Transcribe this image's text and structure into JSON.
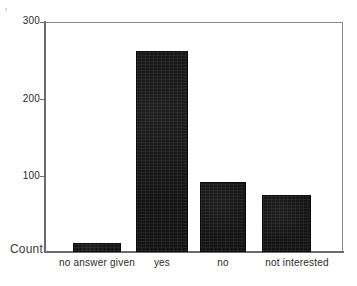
{
  "chart_data": {
    "type": "bar",
    "title": "",
    "subtitle": "",
    "xlabel": "",
    "ylabel": "Count",
    "categories": [
      "no answer given",
      "yes",
      "no",
      "not  interested"
    ],
    "values": [
      12,
      262,
      91,
      75
    ],
    "series": [
      {
        "name": "Count",
        "values": [
          12,
          262,
          91,
          75
        ]
      }
    ],
    "ylim": [
      0,
      300
    ],
    "yticks": [
      100,
      200,
      300
    ],
    "ytick_labels": [
      "100",
      "200",
      "300"
    ],
    "grid": false,
    "legend": false,
    "legend_position": "none",
    "bar_color": "#141414",
    "frame_color": "#8a8a8a",
    "axis_color": "#6b6b6b",
    "background": "#ffffff",
    "annotations": []
  },
  "axes": {
    "y_axis_name": "Count",
    "ticks": [
      {
        "label": "300",
        "value": 300
      },
      {
        "label": "200",
        "value": 200
      },
      {
        "label": "100",
        "value": 100
      }
    ]
  },
  "bars": [
    {
      "label": "no answer given",
      "value": 12
    },
    {
      "label": "yes",
      "value": 262
    },
    {
      "label": "no",
      "value": 91
    },
    {
      "label": "not  interested",
      "value": 75
    }
  ]
}
